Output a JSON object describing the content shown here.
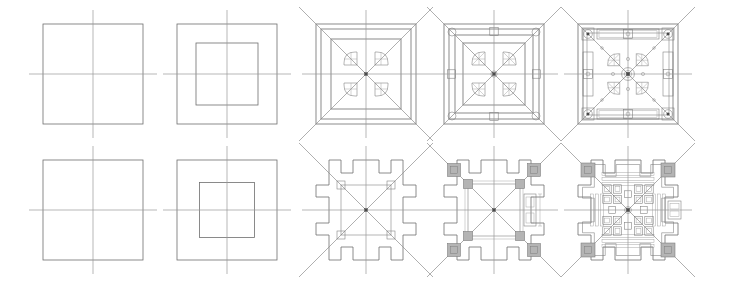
{
  "figure": {
    "title": "Architectural plan development sequence",
    "background_color": "#ffffff",
    "width": 733,
    "height": 288,
    "rows": 2,
    "columns": 5,
    "colors": {
      "axis_line": "#9a9a9a",
      "construction_line": "#8c8c8c",
      "outline": "#6e6e6e",
      "detail_line": "#7a7a7a",
      "fine_line": "#9e9e9e",
      "hatch_fill": "#c9c9c9",
      "pier_fill": "#b4b4b4",
      "node_fill": "#4a4a4a"
    },
    "line_weights": {
      "axis": 0.7,
      "construction": 0.7,
      "outline": 0.8,
      "detail": 0.55,
      "fine": 0.45
    }
  },
  "layout": {
    "panel_centers_x": [
      93,
      227,
      366,
      494,
      628
    ],
    "row_centers_y": [
      74,
      210
    ],
    "square_half_size": 50,
    "axis_overhang": 14,
    "diagonal_overhang": 17
  },
  "rows": [
    {
      "name": "upper-row",
      "label": "Centralized radial plan development",
      "center_y": 74,
      "panels": [
        {
          "index": 1,
          "name": "panel-upper-1",
          "label": "Base square with principal axes",
          "center_x": 93,
          "stage": "square and axes",
          "elements": [
            "outer-square",
            "vertical-axis",
            "horizontal-axis"
          ]
        },
        {
          "index": 2,
          "name": "panel-upper-2",
          "label": "Square with concentric inner square",
          "center_x": 227,
          "stage": "nested squares",
          "elements": [
            "outer-square",
            "inner-square",
            "vertical-axis",
            "horizontal-axis"
          ]
        },
        {
          "index": 3,
          "name": "panel-upper-3",
          "label": "Diagonals with quadrant chambers",
          "center_x": 366,
          "stage": "diagonals and quadrant figures",
          "elements": [
            "outer-square",
            "inner-square",
            "diagonals",
            "quadrant-leaves",
            "axes"
          ]
        },
        {
          "index": 4,
          "name": "panel-upper-4",
          "label": "Columns added at axes and corners",
          "center_x": 494,
          "stage": "column grid",
          "elements": [
            "outer-square",
            "inner-square",
            "diagonals",
            "quadrant-leaves",
            "axial-columns",
            "corner-columns",
            "cross-bracing",
            "axes"
          ]
        },
        {
          "index": 5,
          "name": "panel-upper-5",
          "label": "Completed plan with walls and galleries",
          "center_x": 628,
          "stage": "completed plan",
          "elements": [
            "perimeter-wall",
            "galleries",
            "diagonals",
            "quadrant-leaves",
            "column-grid",
            "central-node",
            "axes"
          ]
        }
      ]
    },
    {
      "name": "lower-row",
      "label": "Cruciform stepped plan development",
      "center_y": 210,
      "panels": [
        {
          "index": 1,
          "name": "panel-lower-1",
          "label": "Base square with principal axes",
          "center_x": 93,
          "stage": "square and axes",
          "elements": [
            "outer-square",
            "vertical-axis",
            "horizontal-axis"
          ]
        },
        {
          "index": 2,
          "name": "panel-lower-2",
          "label": "Square with concentric inner square",
          "center_x": 227,
          "stage": "nested squares",
          "elements": [
            "outer-square",
            "inner-square",
            "vertical-axis",
            "horizontal-axis"
          ]
        },
        {
          "index": 3,
          "name": "panel-lower-3",
          "label": "Stepped perimeter with diagonals",
          "center_x": 366,
          "stage": "stepped outline",
          "elements": [
            "stepped-outline",
            "diagonals",
            "corner-piers",
            "axes"
          ]
        },
        {
          "index": 4,
          "name": "panel-lower-4",
          "label": "Corner piers and wall thickness",
          "center_x": 494,
          "stage": "piers and walls",
          "elements": [
            "stepped-outline",
            "diagonals",
            "corner-piers",
            "inner-piers",
            "side-chamber",
            "axes"
          ]
        },
        {
          "index": 5,
          "name": "panel-lower-5",
          "label": "Completed plan with internal cells",
          "center_x": 628,
          "stage": "completed plan",
          "elements": [
            "stepped-outline",
            "diagonals",
            "corner-piers",
            "cell-grid",
            "side-chambers",
            "central-node",
            "axes"
          ]
        }
      ]
    }
  ]
}
